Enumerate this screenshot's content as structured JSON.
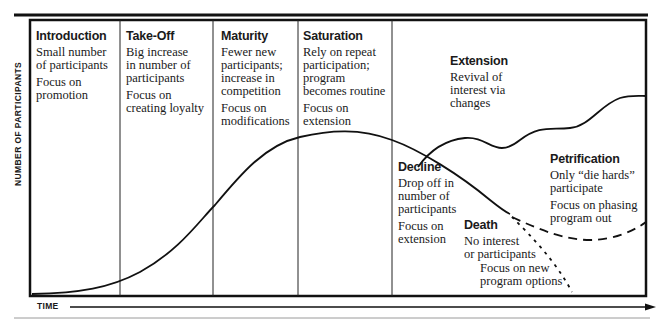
{
  "axes": {
    "y_label": "NUMBER OF PARTICIPANTS",
    "x_label": "TIME"
  },
  "stages": [
    {
      "id": "introduction",
      "title": "Introduction",
      "lines": [
        "Small number\nof participants",
        "Focus on\npromotion"
      ]
    },
    {
      "id": "take-off",
      "title": "Take-Off",
      "lines": [
        "Big increase\nin number of\nparticipants",
        "Focus on\ncreating loyalty"
      ]
    },
    {
      "id": "maturity",
      "title": "Maturity",
      "lines": [
        "Fewer new\nparticipants;\nincrease in\ncompetition",
        "Focus on\nmodifications"
      ]
    },
    {
      "id": "saturation",
      "title": "Saturation",
      "lines": [
        "Rely on repeat\nparticipation;\nprogram\nbecomes routine",
        "Focus on\nextension"
      ]
    },
    {
      "id": "extension",
      "title": "Extension",
      "lines": [
        "Revival of\ninterest via\nchanges"
      ]
    },
    {
      "id": "decline",
      "title": "Decline",
      "lines": [
        "Drop off in\nnumber of\nparticipants",
        "Focus on\nextension"
      ]
    },
    {
      "id": "petrification",
      "title": "Petrification",
      "lines": [
        "Only “die hards”\nparticipate",
        "Focus on phasing\nprogram out"
      ]
    },
    {
      "id": "death",
      "title": "Death",
      "lines": [
        "No interest\nor participants"
      ]
    }
  ],
  "death_note": "Focus on new\nprogram options",
  "colors": {
    "line": "#111111",
    "rule": "#999999",
    "background": "#ffffff"
  }
}
